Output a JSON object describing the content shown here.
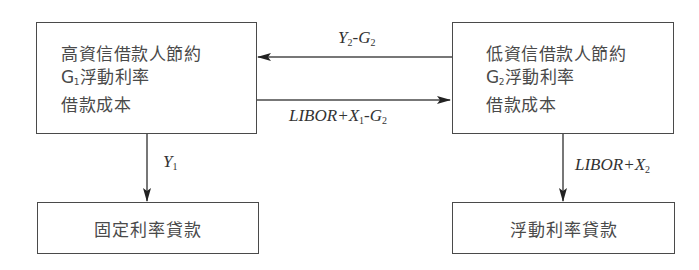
{
  "diagram": {
    "type": "flow",
    "nodes": {
      "high_credit": {
        "lines": [
          "高資信借款人節約",
          "浮動利率",
          "借款成本"
        ],
        "line2_prefix": "G",
        "line2_sub": "1"
      },
      "low_credit": {
        "lines": [
          "低資信借款人節約",
          "浮動利率",
          "借款成本"
        ],
        "line2_prefix": "G",
        "line2_sub": "2"
      },
      "fixed_loan": {
        "label": "固定利率貸款"
      },
      "floating_loan": {
        "label": "浮動利率貸款"
      }
    },
    "edges": {
      "low_to_high": {
        "label_parts": [
          {
            "text": "Y",
            "sub": "2"
          },
          {
            "text": "-G",
            "sub": "2"
          }
        ]
      },
      "high_to_low": {
        "label_parts": [
          {
            "text": "LIBOR+X",
            "sub": "1"
          },
          {
            "text": "-G",
            "sub": "2"
          }
        ]
      },
      "high_to_fixed": {
        "label_parts": [
          {
            "text": "Y",
            "sub": "1"
          }
        ]
      },
      "low_to_floating": {
        "label_parts": [
          {
            "text": "LIBOR+X",
            "sub": "2"
          }
        ]
      }
    },
    "colors": {
      "stroke": "#4a4a4a",
      "text": "#3a3a3a",
      "background": "#ffffff"
    }
  }
}
